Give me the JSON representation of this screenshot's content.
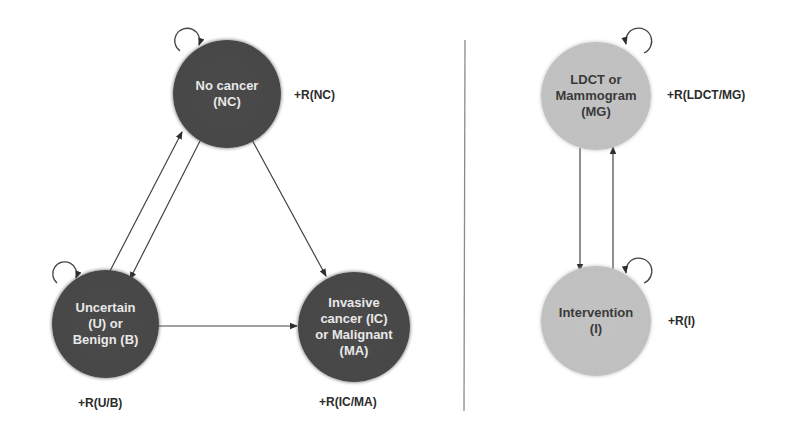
{
  "left_panel": {
    "nodes": {
      "nc": {
        "label": "No cancer\n(NC)",
        "reward": "+R(NC)",
        "fill": "#474747"
      },
      "ub": {
        "label": "Uncertain\n(U) or\nBenign (B)",
        "reward": "+R(U/B)",
        "fill": "#474747"
      },
      "icma": {
        "label": "Invasive\ncancer (IC)\nor Malignant\n(MA)",
        "reward": "+R(IC/MA)",
        "fill": "#474747"
      }
    },
    "edges": [
      {
        "from": "NC",
        "to": "NC",
        "type": "self-loop"
      },
      {
        "from": "U/B",
        "to": "U/B",
        "type": "self-loop"
      },
      {
        "from": "U/B",
        "to": "NC",
        "type": "arrow"
      },
      {
        "from": "NC",
        "to": "U/B",
        "type": "arrow"
      },
      {
        "from": "NC",
        "to": "IC/MA",
        "type": "arrow"
      },
      {
        "from": "U/B",
        "to": "IC/MA",
        "type": "arrow"
      }
    ]
  },
  "right_panel": {
    "nodes": {
      "mg": {
        "label": "LDCT or\nMammogram\n(MG)",
        "reward": "+R(LDCT/MG)",
        "fill": "#c0c0c0"
      },
      "i": {
        "label": "Intervention\n(I)",
        "reward": "+R(I)",
        "fill": "#c0c0c0"
      }
    },
    "edges": [
      {
        "from": "MG",
        "to": "MG",
        "type": "self-loop"
      },
      {
        "from": "I",
        "to": "I",
        "type": "self-loop"
      },
      {
        "from": "MG",
        "to": "I",
        "type": "arrow"
      },
      {
        "from": "I",
        "to": "MG",
        "type": "arrow"
      }
    ]
  },
  "colors": {
    "dark_node": "#474747",
    "light_node": "#c0c0c0",
    "edge": "#3a3a3a",
    "divider": "#8a8a8a"
  }
}
